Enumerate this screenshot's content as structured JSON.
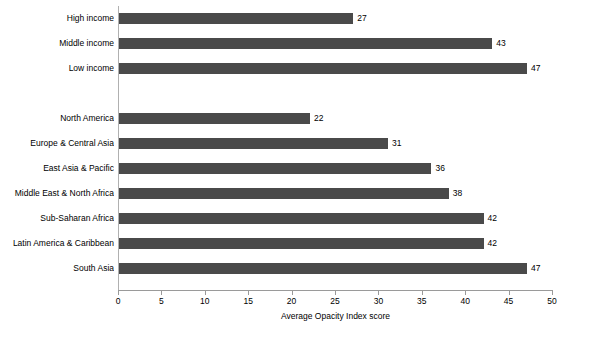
{
  "chart_data": {
    "type": "bar",
    "orientation": "horizontal",
    "title": "",
    "xlabel": "Average Opacity Index score",
    "ylabel": "",
    "xlim": [
      0,
      50
    ],
    "xticks": [
      0,
      5,
      10,
      15,
      20,
      25,
      30,
      35,
      40,
      45,
      50
    ],
    "grid": false,
    "legend": false,
    "bar_color": "#4a4a4a",
    "axis_color": "#9a9a9a",
    "text_color": "#000000",
    "background": "#ffffff",
    "categories": [
      "High income",
      "Middle income",
      "Low income",
      "",
      "North America",
      "Europe & Central Asia",
      "East Asia & Pacific",
      "Middle East & North Africa",
      "Sub-Saharan Africa",
      "Latin America & Caribbean",
      "South Asia"
    ],
    "values": [
      27,
      43,
      47,
      null,
      22,
      31,
      36,
      38,
      42,
      42,
      47
    ],
    "data_labels": [
      "27",
      "43",
      "47",
      "",
      "22",
      "31",
      "36",
      "38",
      "42",
      "42",
      "47"
    ],
    "groups": [
      {
        "name": "Income group",
        "categories": [
          "High income",
          "Middle income",
          "Low income"
        ],
        "values": [
          27,
          43,
          47
        ]
      },
      {
        "name": "Region",
        "categories": [
          "North America",
          "Europe & Central Asia",
          "East Asia & Pacific",
          "Middle East & North Africa",
          "Sub-Saharan Africa",
          "Latin America & Caribbean",
          "South Asia"
        ],
        "values": [
          22,
          31,
          36,
          38,
          42,
          42,
          47
        ]
      }
    ],
    "rows": [
      {
        "label": "High income",
        "value": 27,
        "data_label": "27",
        "clipped": false,
        "spacer": false
      },
      {
        "label": "Middle income",
        "value": 43,
        "data_label": "43",
        "clipped": false,
        "spacer": false
      },
      {
        "label": "Low income",
        "value": 47,
        "data_label": "47",
        "clipped": false,
        "spacer": false
      },
      {
        "label": "",
        "value": null,
        "data_label": "",
        "clipped": false,
        "spacer": true
      },
      {
        "label": "North America",
        "value": 22,
        "data_label": "22",
        "clipped": false,
        "spacer": false
      },
      {
        "label": "Europe & Central Asia",
        "value": 31,
        "data_label": "31",
        "clipped": false,
        "spacer": false
      },
      {
        "label": "East Asia & Pacific",
        "value": 36,
        "data_label": "36",
        "clipped": false,
        "spacer": false
      },
      {
        "label": "Middle East & North Africa",
        "value": 38,
        "data_label": "38",
        "clipped": true,
        "spacer": false
      },
      {
        "label": "Sub-Saharan Africa",
        "value": 42,
        "data_label": "42",
        "clipped": false,
        "spacer": false
      },
      {
        "label": "Latin America & Caribbean",
        "value": 42,
        "data_label": "42",
        "clipped": true,
        "spacer": false
      },
      {
        "label": "South Asia",
        "value": 47,
        "data_label": "47",
        "clipped": false,
        "spacer": false
      }
    ]
  },
  "geometry": {
    "axis_x": 118,
    "px_per_unit": 8.68,
    "row_height": 25,
    "first_row_top": 6,
    "bar_height": 11,
    "baseline_y": 290
  }
}
